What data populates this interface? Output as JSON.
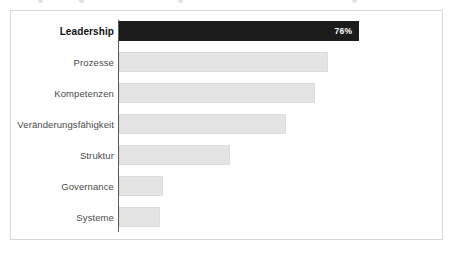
{
  "chart_data": {
    "type": "bar",
    "orientation": "horizontal",
    "title": "",
    "subtitle": "",
    "xlabel": "",
    "ylabel": "",
    "xlim": [
      0,
      100
    ],
    "grid": false,
    "legend": null,
    "units": "percent",
    "categories": [
      "Leadership",
      "Prozesse",
      "Kompetenzen",
      "Veränderungsfähigkeit",
      "Struktur",
      "Governance",
      "Systeme"
    ],
    "values": [
      76,
      66,
      62,
      53,
      35,
      14,
      13
    ],
    "data_labels": [
      "76%",
      "",
      "",
      "",
      "",
      "",
      ""
    ],
    "highlight_index": 0,
    "colors": {
      "bar": "#e4e4e4",
      "bar_border": "#dcdcdc",
      "bar_highlight": "#1b1b1b",
      "value_text": "#ffffff",
      "label_text": "#4a4a4a",
      "label_text_highlight": "#111111",
      "axis_line": "#5a5a5a",
      "frame_border": "#d8d8d8",
      "background": "#ffffff"
    }
  },
  "bars": [
    {
      "label": "Leadership",
      "value": 76,
      "value_label": "76%",
      "highlight": true
    },
    {
      "label": "Prozesse",
      "value": 66,
      "value_label": "",
      "highlight": false
    },
    {
      "label": "Kompetenzen",
      "value": 62,
      "value_label": "",
      "highlight": false
    },
    {
      "label": "Veränderungsfähigkeit",
      "value": 53,
      "value_label": "",
      "highlight": false
    },
    {
      "label": "Struktur",
      "value": 35,
      "value_label": "",
      "highlight": false
    },
    {
      "label": "Governance",
      "value": 14,
      "value_label": "",
      "highlight": false
    },
    {
      "label": "Systeme",
      "value": 13,
      "value_label": "",
      "highlight": false
    }
  ]
}
